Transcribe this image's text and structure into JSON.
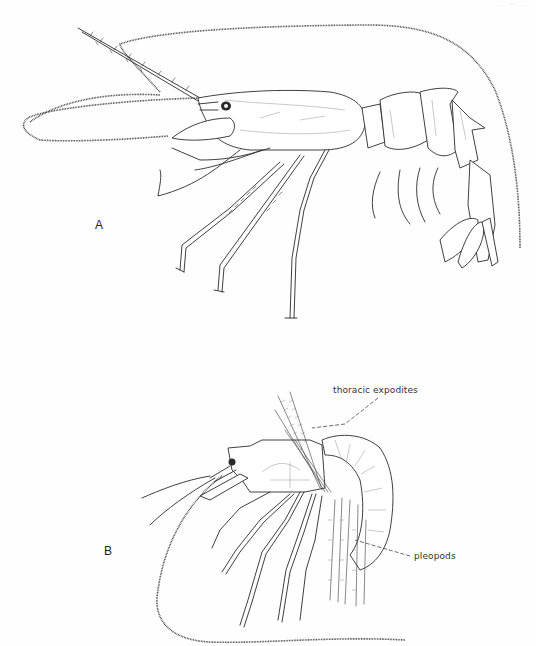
{
  "page": {
    "header_fragment": "… — …",
    "background": "#ffffff",
    "ink_color": "#2a2a2a"
  },
  "figure": {
    "panels": [
      {
        "label": "A",
        "subject": "shrimp lateral view with long antennae, rostrum and extended walking legs"
      },
      {
        "label": "B",
        "subject": "curled shrimp lateral view showing setose thoracic expodites and pleopods",
        "callouts": [
          {
            "text": "thoracic expodites"
          },
          {
            "text": "pleopods"
          }
        ]
      }
    ]
  }
}
